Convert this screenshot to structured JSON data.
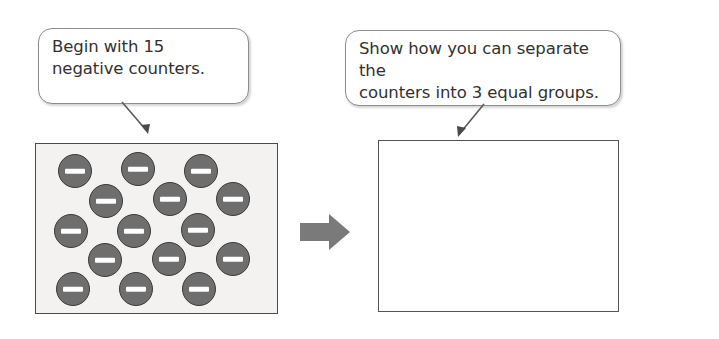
{
  "diagram": {
    "callouts": [
      {
        "id": "begin-callout",
        "text": "Begin with 15\nnegative counters.",
        "points_to": "counters-box"
      },
      {
        "id": "show-callout",
        "text": "Show how you can separate the\ncounters into 3 equal groups.",
        "points_to": "empty-box"
      }
    ],
    "counters_box": {
      "label": "15 negative counters",
      "count": 15,
      "counter_sign": "−",
      "fill_color": "#f3f2f1",
      "border_color": "#4a4a4a",
      "counters": [
        {
          "sign": "−",
          "x": 22,
          "y": 10
        },
        {
          "sign": "−",
          "x": 85,
          "y": 8
        },
        {
          "sign": "−",
          "x": 148,
          "y": 10
        },
        {
          "sign": "−",
          "x": 53,
          "y": 40
        },
        {
          "sign": "−",
          "x": 117,
          "y": 38
        },
        {
          "sign": "−",
          "x": 180,
          "y": 38
        },
        {
          "sign": "−",
          "x": 18,
          "y": 70
        },
        {
          "sign": "−",
          "x": 81,
          "y": 70
        },
        {
          "sign": "−",
          "x": 145,
          "y": 69
        },
        {
          "sign": "−",
          "x": 52,
          "y": 99
        },
        {
          "sign": "−",
          "x": 116,
          "y": 98
        },
        {
          "sign": "−",
          "x": 180,
          "y": 98
        },
        {
          "sign": "−",
          "x": 20,
          "y": 128
        },
        {
          "sign": "−",
          "x": 83,
          "y": 128
        },
        {
          "sign": "−",
          "x": 146,
          "y": 128
        }
      ]
    },
    "arrow": {
      "direction": "right",
      "color": "#7a7a7a"
    },
    "empty_box": {
      "label": "Empty work area for student answer",
      "content": "",
      "fill_color": "#ffffff",
      "border_color": "#55524f"
    }
  }
}
